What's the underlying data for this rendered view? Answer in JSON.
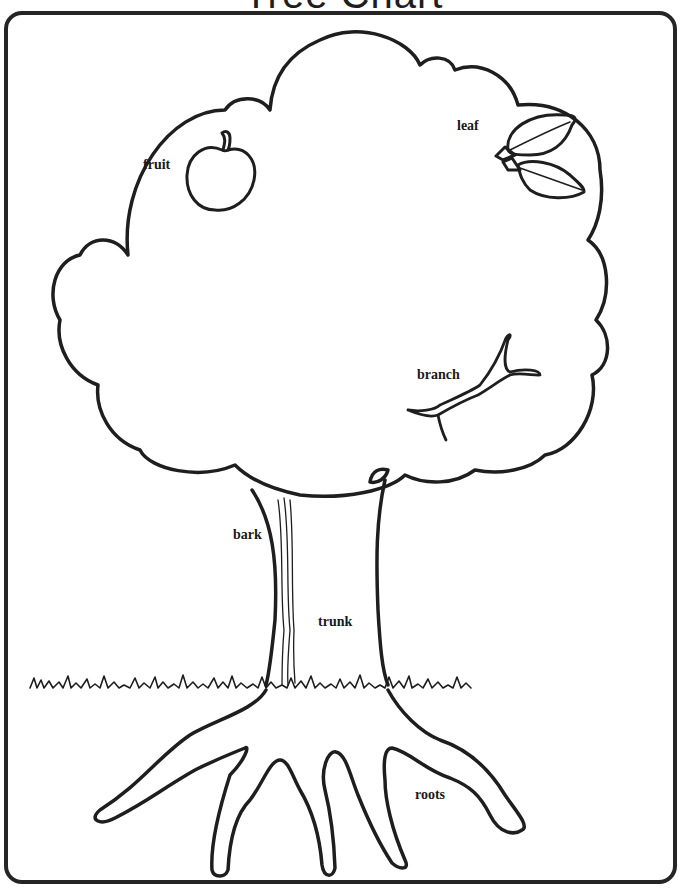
{
  "title": "Tree Chart",
  "labels": {
    "fruit": "fruit",
    "leaf": "leaf",
    "branch": "branch",
    "bark": "bark",
    "trunk": "trunk",
    "roots": "roots"
  },
  "colors": {
    "line": "#1e1e1e",
    "background": "#ffffff"
  }
}
